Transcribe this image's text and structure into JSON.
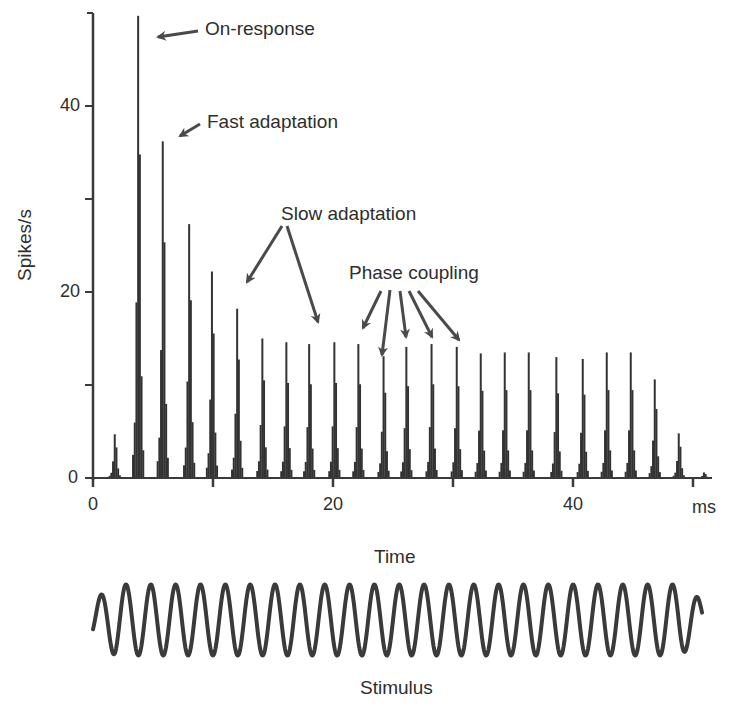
{
  "chart_data": {
    "type": "bar",
    "title": "",
    "xlabel": "Time",
    "x_unit_label": "ms",
    "ylabel": "Spikes/s",
    "xlim": [
      0,
      50
    ],
    "ylim": [
      0,
      50
    ],
    "x_ticks": [
      0,
      10,
      20,
      30,
      40,
      50
    ],
    "x_tick_labels": [
      "0",
      "",
      "20",
      "",
      "40",
      ""
    ],
    "y_ticks": [
      0,
      10,
      20,
      30,
      40
    ],
    "y_tick_labels": [
      "0",
      "",
      "20",
      "",
      "40"
    ],
    "grid": false,
    "legend": null,
    "x": [
      1.8,
      3.75,
      5.8,
      8.0,
      9.9,
      12.0,
      14.1,
      16.1,
      18.0,
      20.1,
      22.1,
      24.2,
      26.1,
      28.2,
      30.3,
      32.3,
      34.3,
      36.3,
      38.6,
      40.8,
      42.8,
      44.8,
      46.8,
      48.8,
      50.9
    ],
    "values": [
      4.7,
      49.7,
      36.2,
      27.3,
      22.2,
      18.2,
      15.0,
      14.6,
      14.4,
      14.6,
      14.4,
      13.1,
      14.1,
      14.4,
      14.1,
      13.4,
      13.5,
      13.5,
      13.0,
      12.8,
      13.5,
      13.5,
      10.6,
      4.8,
      0.6
    ],
    "annotations": [
      {
        "text": "On-response",
        "points_to_x": [
          3.75
        ]
      },
      {
        "text": "Fast adaptation",
        "points_to_x": [
          5.8
        ]
      },
      {
        "text": "Slow adaptation",
        "points_to_x": [
          12.0,
          18.0
        ]
      },
      {
        "text": "Phase coupling",
        "points_to_x": [
          22.1,
          24.2,
          26.1,
          28.2,
          30.3
        ]
      }
    ],
    "stimulus": {
      "label": "Stimulus",
      "type": "sine",
      "period_ms": 2.07,
      "cycles": 24
    }
  },
  "labels": {
    "ylabel": "Spikes/s",
    "xlabel": "Time",
    "xunit": "ms",
    "stimulus": "Stimulus",
    "on_response": "On-response",
    "fast_adaptation": "Fast adaptation",
    "slow_adaptation": "Slow adaptation",
    "phase_coupling": "Phase coupling",
    "ytick_0": "0",
    "ytick_20": "20",
    "ytick_40": "40",
    "xtick_0": "0",
    "xtick_20": "20",
    "xtick_40": "40"
  },
  "colors": {
    "bars": "#333333",
    "axis": "#3a3a3a",
    "text": "#2e2e2e",
    "arrow": "#4a4a4a",
    "stimulus": "#3a3a3a"
  }
}
